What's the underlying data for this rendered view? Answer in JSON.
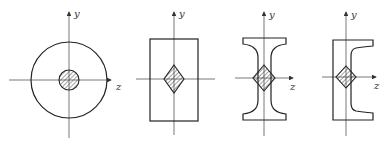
{
  "diagram": {
    "panels": [
      {
        "shape": "hollow-circle-section",
        "core": "circle",
        "axis_labels": {
          "y": "y",
          "z": "z"
        }
      },
      {
        "shape": "rectangle-section",
        "core": "rhombus",
        "axis_labels": {
          "y": "y",
          "z": "z"
        }
      },
      {
        "shape": "i-beam-section",
        "core": "rhombus",
        "axis_labels": {
          "y": "y",
          "z": "z"
        }
      },
      {
        "shape": "channel-section",
        "core": "rhombus",
        "axis_labels": {
          "y": "y",
          "z": "z"
        }
      }
    ],
    "colors": {
      "line": "#222222",
      "axis": "#555555",
      "background": "#ffffff"
    }
  }
}
